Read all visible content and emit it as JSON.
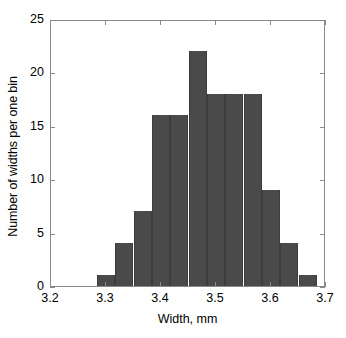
{
  "chart_data": {
    "type": "bar",
    "title": "",
    "xlabel": "Width, mm",
    "ylabel": "Number of widths per one bin",
    "xlim": [
      3.2,
      3.7
    ],
    "ylim": [
      0,
      25
    ],
    "grid": false,
    "legend": null,
    "bin_width": 0.0333,
    "bin_edges": [
      3.2833,
      3.3167,
      3.35,
      3.3833,
      3.4167,
      3.45,
      3.4833,
      3.5167,
      3.55,
      3.5833,
      3.6167,
      3.65,
      3.6833
    ],
    "categories": [
      "3.283-3.317",
      "3.317-3.350",
      "3.350-3.383",
      "3.383-3.417",
      "3.417-3.450",
      "3.450-3.483",
      "3.483-3.517",
      "3.517-3.550",
      "3.550-3.583",
      "3.583-3.617",
      "3.617-3.650",
      "3.650-3.683"
    ],
    "values": [
      1,
      4,
      7,
      16,
      16,
      22,
      18,
      18,
      18,
      9,
      4,
      1
    ],
    "xticks": [
      3.2,
      3.3,
      3.4,
      3.5,
      3.6,
      3.7
    ],
    "xtick_labels": [
      "3.2",
      "3.3",
      "3.4",
      "3.5",
      "3.6",
      "3.7"
    ],
    "yticks": [
      0,
      5,
      10,
      15,
      20,
      25
    ],
    "ytick_labels": [
      "0",
      "5",
      "10",
      "15",
      "20",
      "25"
    ],
    "bar_color": "#4a4a4a",
    "axis_color": "#8a8a8a",
    "background_color": "#ffffff"
  }
}
